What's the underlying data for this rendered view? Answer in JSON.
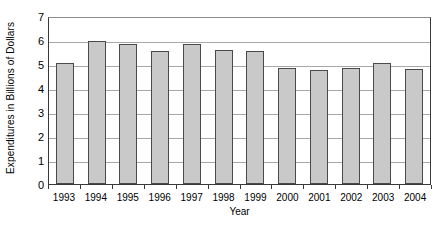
{
  "chart_data": {
    "type": "bar",
    "title": "",
    "xlabel": "Year",
    "ylabel": "Expenditures in Billions of Dollars",
    "categories": [
      "1993",
      "1994",
      "1995",
      "1996",
      "1997",
      "1998",
      "1999",
      "2000",
      "2001",
      "2002",
      "2003",
      "2004"
    ],
    "values": [
      5.05,
      5.95,
      5.85,
      5.55,
      5.85,
      5.6,
      5.55,
      4.85,
      4.75,
      4.85,
      5.05,
      4.8
    ],
    "series": [
      {
        "name": "Expenditures",
        "values": [
          5.05,
          5.95,
          5.85,
          5.55,
          5.85,
          5.6,
          5.55,
          4.85,
          4.75,
          4.85,
          5.05,
          4.8
        ]
      }
    ],
    "ylim": [
      0,
      7
    ],
    "yticks": [
      0,
      1,
      2,
      3,
      4,
      5,
      6,
      7
    ],
    "ytick_labels": [
      "0",
      "1",
      "2",
      "3",
      "4",
      "5",
      "6",
      "7"
    ],
    "grid": "horizontal",
    "legend": "none",
    "bar_color": "#c9c9c9",
    "bar_edge_color": "#4a4a4a",
    "gridline_color": "#a8a8a8",
    "axis_color": "#3a3a3a",
    "background_color": "#ffffff"
  }
}
